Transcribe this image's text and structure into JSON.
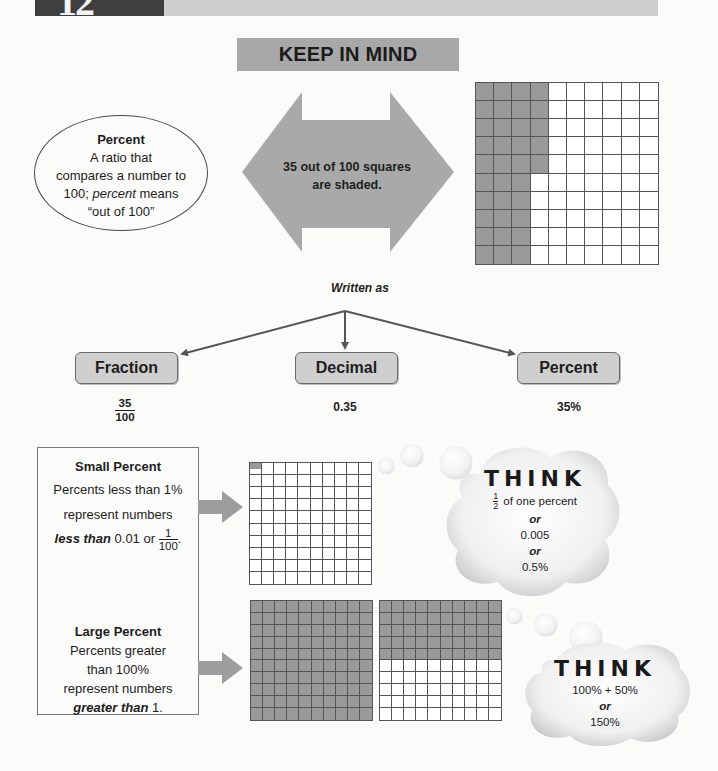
{
  "header": {
    "chapter_number": "12",
    "banner_title": "KEEP IN MIND"
  },
  "definition": {
    "term": "Percent",
    "line1": "A ratio that",
    "line2": "compares a number to",
    "line3_pre": "100; ",
    "line3_italic": "percent",
    "line3_post": " means",
    "line4": "“out of 100”"
  },
  "double_arrow": {
    "text_line1": "35 out of 100 squares",
    "text_line2": "are shaded.",
    "color": "#a9a9a9"
  },
  "main_grid": {
    "rows": 10,
    "cols": 10,
    "shaded_count": 35,
    "shading": "columns 1-3 fully shaded, column 4 top 5 rows shaded",
    "shade_color": "#999999"
  },
  "written_as": {
    "label": "Written as",
    "forms": [
      {
        "name": "Fraction",
        "value_numerator": "35",
        "value_denominator": "100"
      },
      {
        "name": "Decimal",
        "value": "0.35"
      },
      {
        "name": "Percent",
        "value": "35%"
      }
    ]
  },
  "small_percent": {
    "title": "Small Percent",
    "line1": "Percents less than 1%",
    "line2": "represent numbers",
    "line3_bold_italic": "less than",
    "line3_post": " 0.01 or ",
    "frac_numerator": "1",
    "frac_denominator": "100",
    "trailing": ".",
    "grid": {
      "rows": 10,
      "cols": 10,
      "shaded": "half of top-left square"
    },
    "think": {
      "title": "THINK",
      "frac_numerator": "1",
      "frac_denominator": "2",
      "line1_post": " of one percent",
      "or1": "or",
      "line2": "0.005",
      "or2": "or",
      "line3": "0.5%"
    }
  },
  "large_percent": {
    "title": "Large Percent",
    "line1": "Percents greater",
    "line2": "than 100%",
    "line3": "represent numbers",
    "line4_bold_italic": "greater than",
    "line4_post": " 1.",
    "grids": [
      {
        "rows": 10,
        "cols": 10,
        "shaded": "all 100 squares"
      },
      {
        "rows": 10,
        "cols": 10,
        "shaded": "top 5 rows (50 squares)"
      }
    ],
    "think": {
      "title": "THINK",
      "line1": "100% + 50%",
      "or1": "or",
      "line2": "150%"
    }
  }
}
